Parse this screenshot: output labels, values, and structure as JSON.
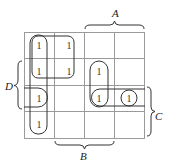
{
  "diagram": {
    "type": "karnaugh-map",
    "rows": 4,
    "cols": 4,
    "variables": {
      "A": {
        "label": "A",
        "position": "top",
        "spans_cols": [
          2,
          3
        ]
      },
      "B": {
        "label": "B",
        "position": "bottom",
        "spans_cols": [
          1,
          2
        ]
      },
      "C": {
        "label": "C",
        "position": "right",
        "spans_rows": [
          2,
          3
        ]
      },
      "D": {
        "label": "D",
        "position": "left",
        "spans_rows": [
          1,
          2
        ]
      }
    },
    "cell_value": "1",
    "ones": [
      {
        "row": 0,
        "col": 0,
        "text": "1"
      },
      {
        "row": 0,
        "col": 1,
        "text": "1"
      },
      {
        "row": 1,
        "col": 0,
        "text": "1"
      },
      {
        "row": 1,
        "col": 1,
        "text": "1"
      },
      {
        "row": 2,
        "col": 0,
        "text": "1"
      },
      {
        "row": 3,
        "col": 0,
        "text": "1"
      },
      {
        "row": 1,
        "col": 2,
        "text": "1"
      },
      {
        "row": 2,
        "col": 2,
        "text": "1"
      },
      {
        "row": 2,
        "col": 3,
        "text": "1"
      }
    ],
    "groupings": [
      {
        "name": "quad-top-left",
        "rows": [
          0,
          1
        ],
        "cols": [
          0,
          1
        ]
      },
      {
        "name": "column-0",
        "rows": [
          0,
          3
        ],
        "cols": [
          0,
          0
        ]
      },
      {
        "name": "wrap-left-row-2",
        "rows": [
          2,
          2
        ],
        "cols": [
          0,
          0
        ],
        "wraps": "left"
      },
      {
        "name": "pair-col-2",
        "rows": [
          1,
          2
        ],
        "cols": [
          2,
          2
        ]
      },
      {
        "name": "wrap-right-row-2",
        "rows": [
          2,
          2
        ],
        "cols": [
          2,
          3
        ],
        "wraps": "right"
      },
      {
        "name": "single-r2c3",
        "rows": [
          2,
          2
        ],
        "cols": [
          3,
          3
        ]
      }
    ],
    "colors": {
      "grid": "#9a9a9a",
      "loop": "#333333",
      "text": "#333333"
    }
  }
}
